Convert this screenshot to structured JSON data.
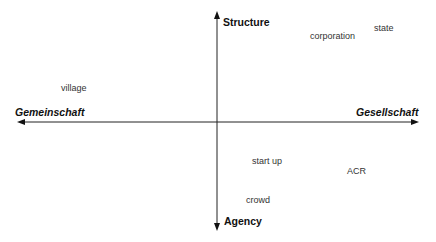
{
  "diagram": {
    "axes": {
      "vertical": {
        "top_label": "Structure",
        "bottom_label": "Agency"
      },
      "horizontal": {
        "left_label": "Gemeinschaft",
        "right_label": "Gesellschaft"
      }
    },
    "items": [
      {
        "label": "corporation",
        "quadrant": "top-right"
      },
      {
        "label": "state",
        "quadrant": "top-right"
      },
      {
        "label": "village",
        "quadrant": "top-left"
      },
      {
        "label": "start up",
        "quadrant": "bottom-right"
      },
      {
        "label": "ACR",
        "quadrant": "bottom-right"
      },
      {
        "label": "crowd",
        "quadrant": "bottom-right"
      }
    ],
    "colors": {
      "axis": "#222222",
      "text": "#333333",
      "background": "#ffffff"
    }
  }
}
